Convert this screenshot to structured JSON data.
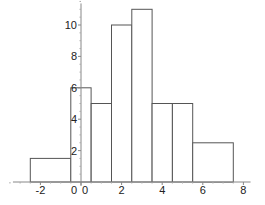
{
  "chart_data": {
    "type": "bar",
    "subtype": "histogram",
    "title": "",
    "xlabel": "",
    "ylabel": "",
    "xlim": [
      -3.5,
      8.5
    ],
    "ylim": [
      0,
      11.5
    ],
    "grid": false,
    "legend": null,
    "x_ticks": [
      -2,
      0,
      2,
      4,
      6,
      8
    ],
    "x_tick_labels": [
      "-2",
      "0",
      "2",
      "4",
      "6",
      "8"
    ],
    "y_ticks": [
      2,
      4,
      6,
      8,
      10
    ],
    "y_tick_labels": [
      "2",
      "4",
      "6",
      "8",
      "10"
    ],
    "y_axis_zero_label": "0",
    "bins": [
      {
        "left": -2.5,
        "right": -0.5,
        "height": 1.5
      },
      {
        "left": -0.5,
        "right": 0.5,
        "height": 6
      },
      {
        "left": 0.5,
        "right": 1.5,
        "height": 5
      },
      {
        "left": 1.5,
        "right": 2.5,
        "height": 10
      },
      {
        "left": 2.5,
        "right": 3.5,
        "height": 11
      },
      {
        "left": 3.5,
        "right": 4.5,
        "height": 5
      },
      {
        "left": 4.5,
        "right": 5.5,
        "height": 5
      },
      {
        "left": 5.5,
        "right": 7.5,
        "height": 2.5
      }
    ],
    "categories": [
      "[-2.5,-0.5]",
      "[-0.5,0.5]",
      "[0.5,1.5]",
      "[1.5,2.5]",
      "[2.5,3.5]",
      "[3.5,4.5]",
      "[4.5,5.5]",
      "[5.5,7.5]"
    ],
    "values": [
      1.5,
      6,
      5,
      10,
      11,
      5,
      5,
      2.5
    ]
  }
}
